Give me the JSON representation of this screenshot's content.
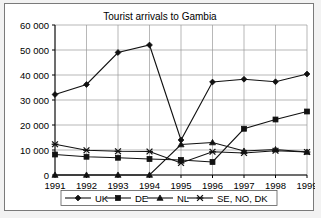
{
  "chart_data": {
    "type": "line",
    "title": "Tourist arrivals to Gambia",
    "xlabel": "",
    "ylabel": "",
    "grid": true,
    "legend_position": "bottom",
    "categories": [
      "1991",
      "1992",
      "1993",
      "1994",
      "1995",
      "1996",
      "1997",
      "1998",
      "1999"
    ],
    "x": [
      1991,
      1992,
      1993,
      1994,
      1995,
      1996,
      1997,
      1998,
      1999
    ],
    "ylim": [
      0,
      60000
    ],
    "ytick_values": [
      0,
      10000,
      20000,
      30000,
      40000,
      50000,
      60000
    ],
    "ytick_labels": [
      "0",
      "10 000",
      "20 000",
      "30 000",
      "40 000",
      "50 000",
      "60 000"
    ],
    "series": [
      {
        "name": "UK",
        "marker": "diamond",
        "values": [
          32200,
          36200,
          49000,
          52000,
          14000,
          37200,
          38300,
          37300,
          40400
        ]
      },
      {
        "name": "DE",
        "marker": "square",
        "values": [
          8200,
          7300,
          6900,
          6400,
          6000,
          5200,
          18500,
          22200,
          25400
        ]
      },
      {
        "name": "NL",
        "marker": "triangle",
        "values": [
          0,
          0,
          0,
          0,
          12200,
          13000,
          9600,
          10200,
          9200
        ]
      },
      {
        "name": "SE, NO, DK",
        "marker": "x-star",
        "values": [
          12300,
          9900,
          9500,
          9400,
          4800,
          9300,
          8800,
          9700,
          9200
        ]
      }
    ]
  },
  "legend": {
    "entries": [
      {
        "label": "UK",
        "marker": "diamond"
      },
      {
        "label": "DE",
        "marker": "square"
      },
      {
        "label": "NL",
        "marker": "triangle"
      },
      {
        "label": "SE, NO, DK",
        "marker": "x-star"
      }
    ]
  },
  "colors": {
    "line": "#111111",
    "grid": "#9a9a9a",
    "axis": "#000000",
    "plot_background": "#ffffff",
    "page_background": "#f2f2f2",
    "border": "#7a7a7a"
  }
}
